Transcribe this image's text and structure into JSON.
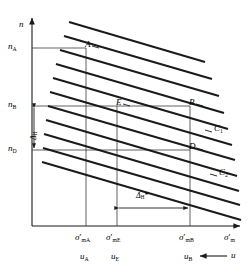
{
  "figure": {
    "type": "technical-diagram",
    "axes": {
      "y_label": "n",
      "x_label_main": "σ",
      "x_label_prime": "′",
      "x_label_sub": "m"
    },
    "y_ticks": [
      {
        "id": "nA",
        "base": "n",
        "sub": "A",
        "y": 48
      },
      {
        "id": "nB",
        "base": "n",
        "sub": "B",
        "y": 106
      },
      {
        "id": "nD",
        "base": "n",
        "sub": "D",
        "y": 150
      }
    ],
    "x_ticks": [
      {
        "id": "smA",
        "base": "σ",
        "prime": "′",
        "sub": "mA",
        "x": 86
      },
      {
        "id": "smE",
        "base": "σ",
        "prime": "′",
        "sub": "mE",
        "x": 117
      },
      {
        "id": "smB",
        "base": "σ",
        "prime": "′",
        "sub": "mB",
        "x": 190
      }
    ],
    "u_ticks": [
      {
        "id": "uA",
        "base": "u",
        "sub": "A",
        "x": 86
      },
      {
        "id": "uE",
        "base": "u",
        "sub": "E",
        "x": 117
      },
      {
        "id": "uB",
        "base": "u",
        "sub": "B",
        "x": 190
      }
    ],
    "u_arrow_label": "u",
    "points": [
      {
        "id": "A",
        "label": "A",
        "x": 86,
        "y": 48
      },
      {
        "id": "B",
        "label": "B",
        "x": 190,
        "y": 106
      },
      {
        "id": "E",
        "label": "E",
        "x": 117,
        "y": 106
      },
      {
        "id": "D",
        "label": "D",
        "x": 190,
        "y": 150
      }
    ],
    "curves": [
      {
        "id": "C1",
        "base": "C",
        "sub": "1"
      },
      {
        "id": "C2",
        "base": "C",
        "sub": "2"
      }
    ],
    "annotations": {
      "vertical_delta": {
        "base": "Δ",
        "sub": "H",
        "star": ""
      },
      "horizontal_delta": {
        "base": "Δ",
        "sub": "H",
        "star": "*"
      }
    },
    "line_family": {
      "count": 11,
      "description": "parallel descending compression lines"
    },
    "colors": {
      "stroke": "#1a1a1a",
      "thin": "#4d4d4d",
      "background": "#ffffff"
    }
  }
}
